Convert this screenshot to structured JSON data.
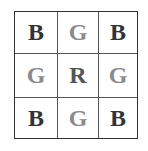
{
  "diagram": {
    "type": "color-filter-grid",
    "rows": 3,
    "cols": 3,
    "cells": [
      {
        "label": "B",
        "color": "#333333"
      },
      {
        "label": "G",
        "color": "#8a8a8a"
      },
      {
        "label": "B",
        "color": "#333333"
      },
      {
        "label": "G",
        "color": "#8a8a8a"
      },
      {
        "label": "R",
        "color": "#555555"
      },
      {
        "label": "G",
        "color": "#8a8a8a"
      },
      {
        "label": "B",
        "color": "#333333"
      },
      {
        "label": "G",
        "color": "#8a8a8a"
      },
      {
        "label": "B",
        "color": "#333333"
      }
    ]
  }
}
